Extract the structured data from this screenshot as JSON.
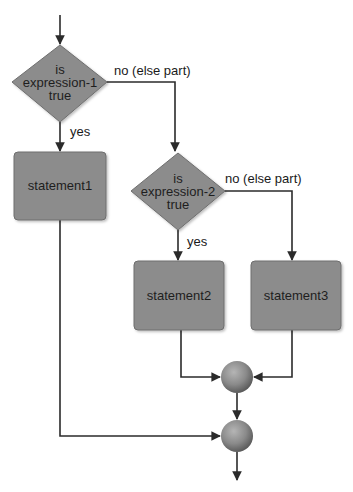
{
  "diagram": {
    "colors": {
      "node_fill": "#8c8c8c",
      "node_stroke": "#6e6e6e",
      "edge": "#2b2b2b",
      "text": "#1e1e1e",
      "background": "#ffffff"
    },
    "decisions": [
      {
        "id": "d1",
        "lines": [
          "is",
          "expression-1",
          "true"
        ]
      },
      {
        "id": "d2",
        "lines": [
          "is",
          "expression-2",
          "true"
        ]
      }
    ],
    "statements": [
      {
        "id": "s1",
        "label": "statement1"
      },
      {
        "id": "s2",
        "label": "statement2"
      },
      {
        "id": "s3",
        "label": "statement3"
      }
    ],
    "connectors": [
      {
        "id": "j1",
        "type": "junction"
      },
      {
        "id": "j2",
        "type": "junction"
      }
    ],
    "edge_labels": {
      "d1_no": "no (else part)",
      "d1_yes": "yes",
      "d2_no": "no (else part)",
      "d2_yes": "yes"
    }
  }
}
